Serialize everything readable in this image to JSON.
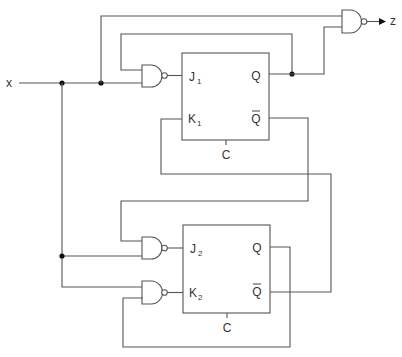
{
  "diagram": {
    "type": "sequential-logic-circuit",
    "input_label": "x",
    "output_label": "z",
    "flip_flops": [
      {
        "id": "FF1",
        "j_label": "J",
        "j_sub": "1",
        "k_label": "K",
        "k_sub": "1",
        "q_label": "Q",
        "qbar_label": "Q",
        "clock_label": "C"
      },
      {
        "id": "FF2",
        "j_label": "J",
        "j_sub": "2",
        "k_label": "K",
        "k_sub": "2",
        "q_label": "Q",
        "qbar_label": "Q",
        "clock_label": "C"
      }
    ],
    "gates": [
      {
        "id": "nand-j1",
        "type": "NAND",
        "inputs": [
          "x",
          "Q1"
        ],
        "output": "J1"
      },
      {
        "id": "nand-z",
        "type": "NAND",
        "inputs": [
          "x",
          "Q1"
        ],
        "output": "z"
      },
      {
        "id": "nand-j2",
        "type": "NAND",
        "inputs": [
          "Q1bar",
          "x"
        ],
        "output": "J2"
      },
      {
        "id": "nand-k2",
        "type": "NAND",
        "inputs": [
          "x",
          "Q2"
        ],
        "output": "K2"
      }
    ],
    "connections": [
      {
        "from": "Q2bar",
        "to": "K1"
      },
      {
        "from": "Q1",
        "to": "nand-z"
      },
      {
        "from": "Q1",
        "to": "nand-j1"
      }
    ],
    "colors": {
      "wire": "#555555",
      "junction": "#111111",
      "text": "#333333"
    }
  }
}
